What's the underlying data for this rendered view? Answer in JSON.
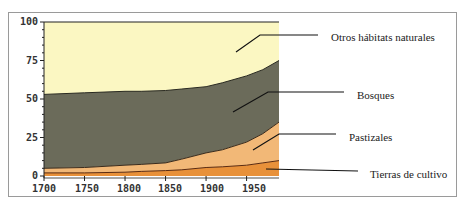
{
  "chart_data": {
    "type": "area",
    "stacked": true,
    "title": "",
    "xlabel": "",
    "ylabel": "",
    "ylim": [
      0,
      100
    ],
    "xlim": [
      1700,
      1990
    ],
    "x_ticks": [
      "1700",
      "1750",
      "1800",
      "1850",
      "1900",
      "1950"
    ],
    "x_tick_values": [
      1700,
      1750,
      1800,
      1850,
      1900,
      1950
    ],
    "y_ticks": [
      "0",
      "25",
      "50",
      "75",
      "100"
    ],
    "y_tick_values": [
      0,
      25,
      50,
      75,
      100
    ],
    "x": [
      1700,
      1750,
      1800,
      1820,
      1850,
      1870,
      1900,
      1920,
      1950,
      1970,
      1990
    ],
    "series": [
      {
        "name": "Tierras de cultivo",
        "color": "#e8913a",
        "values": [
          2,
          2,
          2.5,
          3,
          3.5,
          4,
          5.5,
          6,
          7,
          8.5,
          10
        ]
      },
      {
        "name": "Pastizales",
        "color": "#f2b877",
        "values": [
          3,
          3.5,
          4.5,
          4.5,
          5,
          7,
          9.5,
          11,
          15,
          19,
          25
        ]
      },
      {
        "name": "Bosques",
        "color": "#6b6b5a",
        "values": [
          48,
          48.5,
          48,
          47.5,
          47,
          45.5,
          43,
          43.5,
          43,
          41.5,
          40
        ]
      },
      {
        "name": "Otros hábitats naturales",
        "color": "#fbf7c2",
        "values": [
          47,
          46,
          45,
          45,
          44.5,
          43.5,
          42,
          39.5,
          35,
          31,
          25
        ]
      }
    ],
    "legend_position": "right, leader lines to areas"
  },
  "labels": {
    "y": [
      "100",
      "75",
      "50",
      "25",
      "0"
    ],
    "x": [
      "1700",
      "1750",
      "1800",
      "1850",
      "1900",
      "1950"
    ],
    "legend": {
      "otros": "Otros hábitats naturales",
      "bosques": "Bosques",
      "pastizales": "Pastizales",
      "cultivo": "Tierras de cultivo"
    }
  }
}
